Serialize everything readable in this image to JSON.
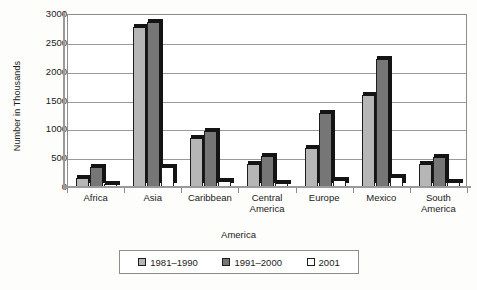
{
  "chart_data": {
    "type": "bar",
    "title": "",
    "xlabel": "America",
    "ylabel": "Number in Thousands",
    "ylim": [
      0,
      3000
    ],
    "yticks": [
      0,
      500,
      1000,
      1500,
      2000,
      2500,
      3000
    ],
    "ytick_labels": [
      "0",
      "500",
      "1000",
      "1500",
      "2000",
      "2500",
      "3000"
    ],
    "grid": true,
    "legend_position": "bottom",
    "categories": [
      "Africa",
      "Asia",
      "Caribbean",
      "Central America",
      "Europe",
      "Mexico",
      "South America"
    ],
    "category_labels": [
      [
        "Africa"
      ],
      [
        "Asia"
      ],
      [
        "Caribbean"
      ],
      [
        "Central",
        "America"
      ],
      [
        "Europe"
      ],
      [
        "Mexico"
      ],
      [
        "South",
        "America"
      ]
    ],
    "series": [
      {
        "name": "1981–1990",
        "color": "#b6b6b6",
        "values": [
          150,
          2770,
          850,
          400,
          670,
          1600,
          400
        ]
      },
      {
        "name": "1991–2000",
        "color": "#767676",
        "values": [
          350,
          2860,
          980,
          530,
          1280,
          2220,
          520
        ]
      },
      {
        "name": "2001",
        "color": "#ffffff",
        "values": [
          50,
          350,
          100,
          70,
          120,
          180,
          80
        ]
      }
    ]
  },
  "legend": {
    "items": [
      {
        "label": "1981–1990",
        "color": "#b6b6b6"
      },
      {
        "label": "1991–2000",
        "color": "#767676"
      },
      {
        "label": "2001",
        "color": "#ffffff"
      }
    ]
  }
}
